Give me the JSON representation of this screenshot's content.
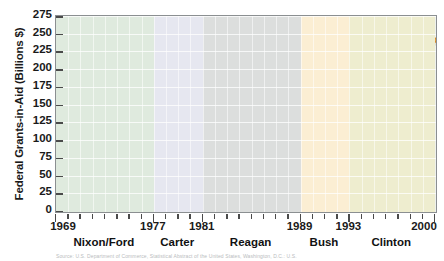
{
  "chart_data": {
    "type": "line",
    "title": "",
    "xlabel": "",
    "ylabel": "Federal Grants-in-Aid (Billions $)",
    "ylim": [
      0,
      275
    ],
    "xlim": [
      1969,
      2000
    ],
    "yticks": [
      0,
      25,
      50,
      75,
      100,
      125,
      150,
      175,
      200,
      225,
      250,
      275
    ],
    "xticks": [
      1969,
      1977,
      1981,
      1989,
      1993,
      2000
    ],
    "grid": "horizontal",
    "legend": "none",
    "series": [
      {
        "name": "Federal Grants-in-Aid",
        "color": "#D98A2B",
        "x": [
          1969,
          1970,
          1971,
          1972,
          1973,
          1974,
          1975,
          1976,
          1977,
          1978,
          1979,
          1980,
          1981,
          1982,
          1983,
          1984,
          1985,
          1986,
          1987,
          1988,
          1989,
          1990,
          1991,
          1992,
          1993,
          1994,
          1995,
          1996,
          1997,
          1998,
          1999,
          2000
        ],
        "values": [
          25,
          30,
          35,
          42,
          48,
          52,
          58,
          63,
          72,
          82,
          88,
          93,
          95,
          97,
          99,
          102,
          106,
          110,
          112,
          116,
          122,
          135,
          155,
          178,
          194,
          200,
          215,
          222,
          228,
          236,
          248,
          241
        ]
      }
    ],
    "bands": [
      {
        "label": "Nixon/Ford",
        "start": 1969,
        "end": 1977,
        "color": "#dfeade"
      },
      {
        "label": "Carter",
        "start": 1977,
        "end": 1981,
        "color": "#e6e7f0"
      },
      {
        "label": "Reagan",
        "start": 1981,
        "end": 1989,
        "color": "#dcdedd"
      },
      {
        "label": "Bush",
        "start": 1989,
        "end": 1993,
        "color": "#fbeed3"
      },
      {
        "label": "Clinton",
        "start": 1993,
        "end": 2000,
        "color": "#eeedcf"
      }
    ],
    "axis_color": "#8b8f91"
  },
  "caption": "Source: U.S. Department of Commerce, Statistical Abstract of the United States, Washington, D.C.: U.S."
}
